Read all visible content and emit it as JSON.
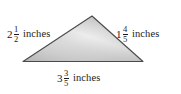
{
  "figure": {
    "type": "triangle-with-side-measurements",
    "shape_name": "triangle",
    "fill_gradient_light": "#f2f2f2",
    "fill_gradient_mid": "#cfcfcf",
    "fill_gradient_dark": "#9a9a9a",
    "outline_color": "#4a4a4a",
    "background_color": "#ffffff"
  },
  "labels": {
    "left_side": {
      "whole": "2",
      "numerator": "1",
      "denominator": "2",
      "unit": "inches"
    },
    "right_side": {
      "whole": "1",
      "numerator": "4",
      "denominator": "5",
      "unit": "inches"
    },
    "base_side": {
      "whole": "3",
      "numerator": "3",
      "denominator": "5",
      "unit": "inches"
    }
  }
}
